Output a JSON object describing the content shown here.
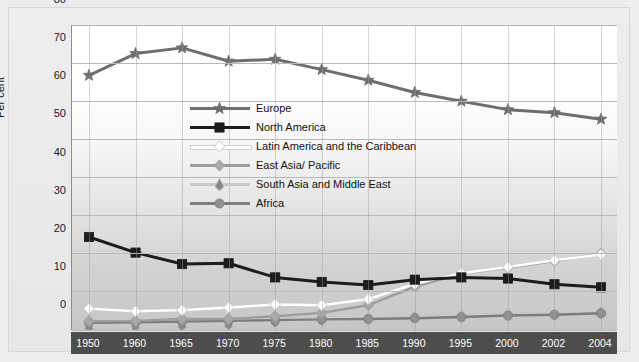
{
  "chart_data": {
    "type": "line",
    "title": "",
    "xlabel": "",
    "ylabel": "Per cent",
    "ylim": [
      0,
      80
    ],
    "ytick_step": 10,
    "yticks": [
      "0",
      "10",
      "20",
      "30",
      "40",
      "50",
      "60",
      "70",
      "80"
    ],
    "grid": true,
    "legend_position": "inside-upper-center",
    "categories": [
      "1950",
      "1960",
      "1965",
      "1970",
      "1975",
      "1980",
      "1985",
      "1990",
      "1995",
      "2000",
      "2002",
      "2004"
    ],
    "series": [
      {
        "name": "Europe",
        "marker": "star",
        "color": "#6e6e6e",
        "line_color": "#6e6e6e",
        "values": [
          66.8,
          72.5,
          74.0,
          70.5,
          71.0,
          68.3,
          65.5,
          62.3,
          60.0,
          57.8,
          57.0,
          55.3
        ]
      },
      {
        "name": "North America",
        "marker": "square",
        "color": "#1c1c1c",
        "line_color": "#1c1c1c",
        "values": [
          24.4,
          20.3,
          17.3,
          17.5,
          13.8,
          12.6,
          11.8,
          13.2,
          13.8,
          13.5,
          12.0,
          11.2
        ]
      },
      {
        "name": "Latin America and the Caribbean",
        "marker": "diamond",
        "color": "#ffffff",
        "line_color": "#ffffff",
        "values": [
          5.6,
          4.9,
          5.2,
          5.9,
          6.7,
          6.5,
          8.1,
          12.1,
          14.9,
          16.5,
          18.3,
          19.8
        ]
      },
      {
        "name": "East Asia/ Pacific",
        "marker": "diamond",
        "color": "#a8a8a8",
        "line_color": "#9d9d9d",
        "values": [
          2.3,
          2.4,
          2.9,
          2.9,
          3.6,
          4.5,
          6.5,
          11.3,
          14.8,
          16.3,
          18.1,
          20.0
        ]
      },
      {
        "name": "South Asia and Middle East",
        "marker": "triangle",
        "color": "#8a8a8a",
        "line_color": "#c9c9c9",
        "values": [
          1.0,
          1.1,
          1.3,
          1.6,
          2.2,
          2.7,
          3.0,
          3.4,
          3.6,
          3.9,
          4.1,
          4.5
        ]
      },
      {
        "name": "Africa",
        "marker": "circle",
        "color": "#8f8f8f",
        "line_color": "#7d7d7d",
        "values": [
          1.9,
          2.0,
          2.2,
          2.4,
          2.6,
          2.8,
          2.9,
          3.1,
          3.4,
          3.8,
          4.0,
          4.4
        ]
      }
    ]
  },
  "axis": {
    "y_title": "Per cent"
  },
  "colors": {
    "background": "#ececec",
    "axis_band": "#4d4d4d",
    "grid": "#b9b9b9"
  }
}
